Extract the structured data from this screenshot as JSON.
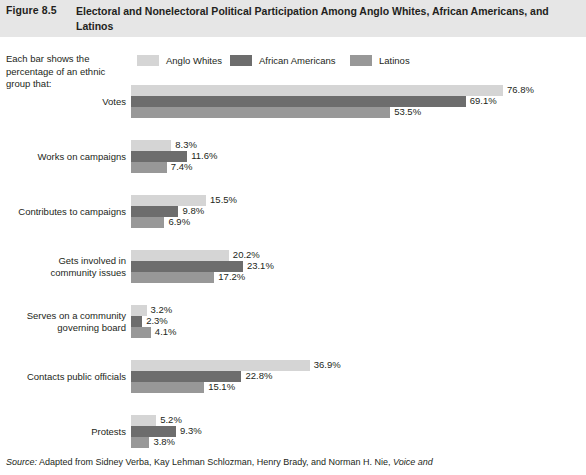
{
  "figure": {
    "number": "Figure 8.5",
    "title": "Electoral and Nonelectoral Political Participation Among Anglo Whites, African Americans, and Latinos"
  },
  "intro_text": "Each bar shows the percentage of an ethnic group that:",
  "source": {
    "prefix": "Source:",
    "body": " Adapted from Sidney Verba, Kay Lehman Schlozman, Henry Brady, and Norman H. Nie, ",
    "title": "Voice and"
  },
  "colors": {
    "anglo_whites": "#d5d5d5",
    "african_americans": "#6d6d6d",
    "latinos": "#989898",
    "header_band": "#e6e6e6",
    "text": "#231f20"
  },
  "chart_data": {
    "type": "bar",
    "orientation": "horizontal",
    "title": "Electoral and Nonelectoral Political Participation Among Anglo Whites, African Americans, and Latinos",
    "xlabel": "",
    "ylabel": "",
    "xlim": [
      0,
      76.8
    ],
    "grid": false,
    "legend_position": "top",
    "value_suffix": "%",
    "categories": [
      "Votes",
      "Works on campaigns",
      "Contributes to campaigns",
      "Gets involved in community issues",
      "Serves on a community governing board",
      "Contacts public officials",
      "Protests"
    ],
    "category_lines": [
      [
        "Votes"
      ],
      [
        "Works on campaigns"
      ],
      [
        "Contributes to campaigns"
      ],
      [
        "Gets involved in",
        "community issues"
      ],
      [
        "Serves on a community",
        "governing board"
      ],
      [
        "Contacts public officials"
      ],
      [
        "Protests"
      ]
    ],
    "series": [
      {
        "name": "Anglo Whites",
        "color": "#d5d5d5",
        "values": [
          76.8,
          8.3,
          15.5,
          20.2,
          3.2,
          36.9,
          5.2
        ],
        "labels": [
          "76.8%",
          "8.3%",
          "15.5%",
          "20.2%",
          "3.2%",
          "36.9%",
          "5.2%"
        ]
      },
      {
        "name": "African Americans",
        "color": "#6d6d6d",
        "values": [
          69.1,
          11.6,
          9.8,
          23.1,
          2.3,
          22.8,
          9.3
        ],
        "labels": [
          "69.1%",
          "11.6%",
          "9.8%",
          "23.1%",
          "2.3%",
          "22.8%",
          "9.3%"
        ]
      },
      {
        "name": "Latinos",
        "color": "#989898",
        "values": [
          53.5,
          7.4,
          6.9,
          17.2,
          4.1,
          15.1,
          3.8
        ],
        "labels": [
          "53.5%",
          "7.4%",
          "6.9%",
          "17.2%",
          "4.1%",
          "15.1%",
          "3.8%"
        ]
      }
    ]
  }
}
